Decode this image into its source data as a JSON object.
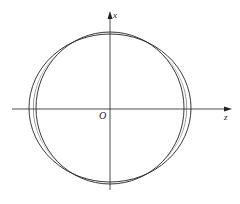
{
  "diagram": {
    "axes": {
      "vertical_label": "x",
      "horizontal_label": "z",
      "origin_label": "O"
    },
    "colors": {
      "stroke": "#222222",
      "shade": "#8c8c8c",
      "background": "#ffffff"
    }
  }
}
